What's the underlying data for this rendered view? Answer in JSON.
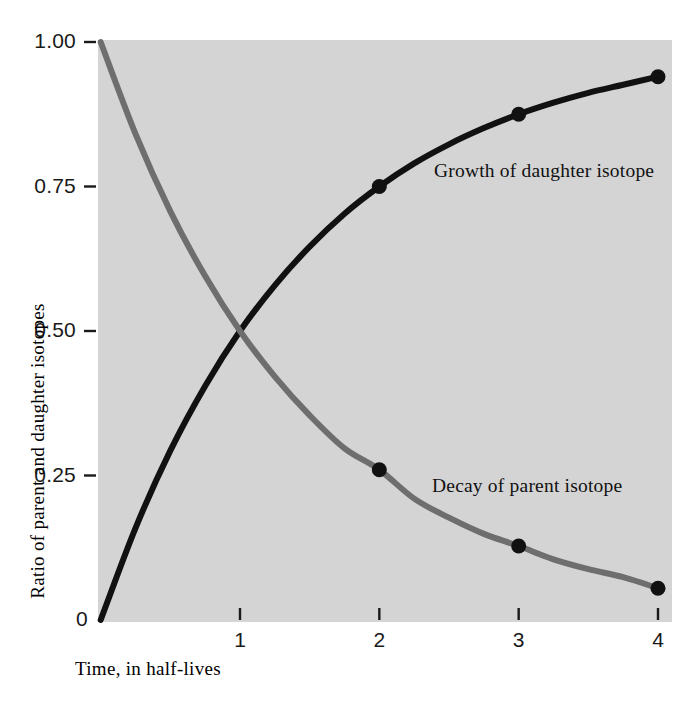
{
  "chart_data": {
    "type": "line",
    "title": "",
    "subtitle": "",
    "xlabel": "Time, in half-lives",
    "ylabel": "Ratio of parent and daughter isotopes",
    "xlim": [
      0,
      4.1
    ],
    "ylim": [
      0,
      1.0
    ],
    "grid": false,
    "legend_position": "inline-annotations",
    "background_color": "#d4d4d4",
    "page_background_color": "#ffffff",
    "xticks": [
      {
        "value": 1,
        "label": "1"
      },
      {
        "value": 2,
        "label": "2"
      },
      {
        "value": 3,
        "label": "3"
      },
      {
        "value": 4,
        "label": "4"
      }
    ],
    "yticks": [
      {
        "value": 0.0,
        "label": "0"
      },
      {
        "value": 0.25,
        "label": "0.25"
      },
      {
        "value": 0.5,
        "label": "0.50"
      },
      {
        "value": 0.75,
        "label": "0.75"
      },
      {
        "value": 1.0,
        "label": "1.00"
      }
    ],
    "series": [
      {
        "name": "Growth of daughter isotope",
        "annotation": "Growth of daughter isotope",
        "color": "#111111",
        "line_width": 6,
        "x": [
          0,
          0.25,
          0.5,
          0.75,
          1,
          1.25,
          1.5,
          1.75,
          2,
          2.25,
          2.5,
          2.75,
          3,
          3.25,
          3.5,
          3.75,
          4
        ],
        "values": [
          0,
          0.159,
          0.293,
          0.405,
          0.5,
          0.579,
          0.646,
          0.703,
          0.75,
          0.79,
          0.823,
          0.851,
          0.875,
          0.895,
          0.912,
          0.926,
          0.94
        ],
        "markers": [
          {
            "x": 2,
            "y": 0.75
          },
          {
            "x": 3,
            "y": 0.875
          },
          {
            "x": 4,
            "y": 0.94
          }
        ]
      },
      {
        "name": "Decay of parent isotope",
        "annotation": "Decay of parent isotope",
        "color": "#6e6e6e",
        "line_width": 6,
        "x": [
          0,
          0.25,
          0.5,
          0.75,
          1,
          1.25,
          1.5,
          1.75,
          2,
          2.25,
          2.5,
          2.75,
          3,
          3.25,
          3.5,
          3.75,
          4
        ],
        "values": [
          1.0,
          0.841,
          0.707,
          0.595,
          0.5,
          0.421,
          0.354,
          0.297,
          0.26,
          0.21,
          0.177,
          0.149,
          0.128,
          0.105,
          0.088,
          0.074,
          0.055
        ],
        "markers": [
          {
            "x": 2,
            "y": 0.26
          },
          {
            "x": 3,
            "y": 0.128
          },
          {
            "x": 4,
            "y": 0.055
          }
        ]
      }
    ]
  },
  "axes": {
    "x_title": "Time, in half-lives",
    "y_title": "Ratio of parent and daughter isotopes",
    "x_tick_labels": [
      "1",
      "2",
      "3",
      "4"
    ],
    "y_tick_labels": [
      "0",
      "0.25",
      "0.50",
      "0.75",
      "1.00"
    ]
  },
  "annotations": {
    "growth": "Growth of daughter isotope",
    "decay": "Decay of parent isotope"
  }
}
